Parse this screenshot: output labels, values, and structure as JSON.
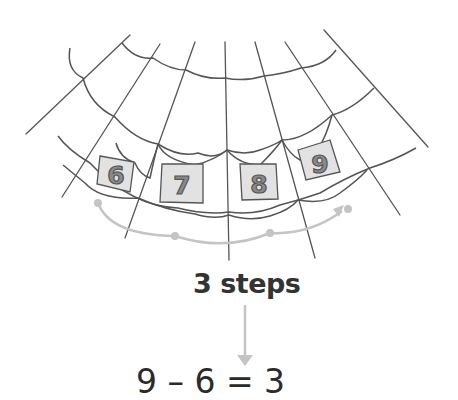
{
  "diagram": {
    "type": "spider-web number line",
    "tiles": [
      {
        "label": "6",
        "cx": 117,
        "cy": 174
      },
      {
        "label": "7",
        "cx": 182,
        "cy": 183
      },
      {
        "label": "8",
        "cx": 256,
        "cy": 180
      },
      {
        "label": "9",
        "cx": 320,
        "cy": 163
      }
    ],
    "hops": {
      "start": "6",
      "end": "9",
      "count": 3
    },
    "steps_label": "3 steps",
    "equation": "9 – 6 = 3"
  },
  "colors": {
    "web_line": "#555555",
    "tile_fill": "#e2e2e2",
    "digit_fill": "#8a8a8a",
    "digit_stroke": "#555555",
    "hop_arrow": "#c4c4c4",
    "text": "#333333"
  }
}
